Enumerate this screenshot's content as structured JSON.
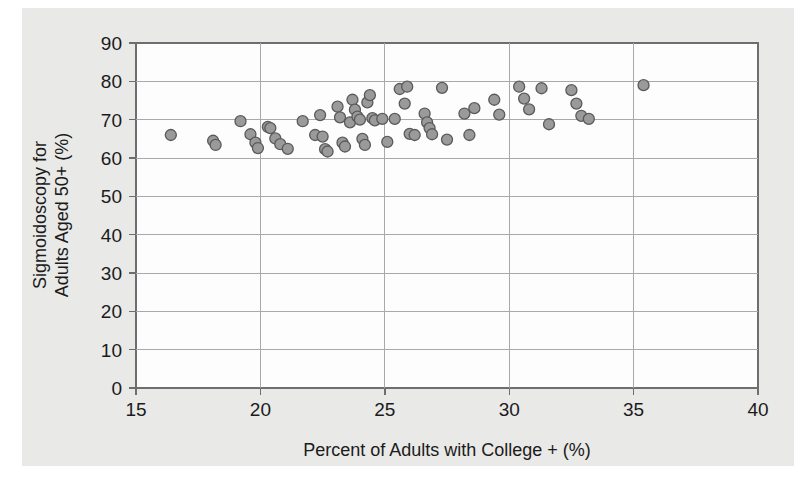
{
  "figure": {
    "background_color": "#ffffff",
    "panel_color": "#e9e9e7",
    "plot_area_color": "#fdfdfd",
    "frame_color": "#6e6e6e",
    "gridline_color": "#a9a9a9",
    "marker_fill_color": "#9a9a9a",
    "marker_stroke_color": "#5a5a5a"
  },
  "chart_data": {
    "type": "scatter",
    "title": "",
    "xlabel": "Percent of Adults with College + (%)",
    "ylabel": "Sigmoidoscopy for Adults Aged 50+ (%)",
    "ylabel_line1": "Sigmoidoscopy for",
    "ylabel_line2": "Adults Aged 50+ (%)",
    "xlim": [
      15,
      40
    ],
    "ylim": [
      0,
      90
    ],
    "xticks": [
      15,
      20,
      25,
      30,
      35,
      40
    ],
    "yticks": [
      0,
      10,
      20,
      30,
      40,
      50,
      60,
      70,
      80,
      90
    ],
    "xtick_labels": [
      "15",
      "20",
      "25",
      "30",
      "35",
      "40"
    ],
    "ytick_labels": [
      "0",
      "10",
      "20",
      "30",
      "40",
      "50",
      "60",
      "70",
      "80",
      "90"
    ],
    "grid": true,
    "grid_axes": "both",
    "legend": false,
    "legend_position": "none",
    "marker": "circle",
    "marker_size": 11,
    "n_points": 62,
    "points": [
      {
        "x": 16.4,
        "y": 66.0
      },
      {
        "x": 18.1,
        "y": 64.5
      },
      {
        "x": 18.2,
        "y": 63.4
      },
      {
        "x": 19.2,
        "y": 69.6
      },
      {
        "x": 19.6,
        "y": 66.2
      },
      {
        "x": 19.8,
        "y": 64.0
      },
      {
        "x": 19.9,
        "y": 62.6
      },
      {
        "x": 20.3,
        "y": 68.1
      },
      {
        "x": 20.4,
        "y": 67.8
      },
      {
        "x": 20.6,
        "y": 65.1
      },
      {
        "x": 20.8,
        "y": 63.6
      },
      {
        "x": 21.1,
        "y": 62.4
      },
      {
        "x": 21.7,
        "y": 69.6
      },
      {
        "x": 22.2,
        "y": 66.0
      },
      {
        "x": 22.4,
        "y": 71.2
      },
      {
        "x": 22.5,
        "y": 65.6
      },
      {
        "x": 22.6,
        "y": 62.3
      },
      {
        "x": 22.7,
        "y": 61.7
      },
      {
        "x": 23.1,
        "y": 73.4
      },
      {
        "x": 23.2,
        "y": 70.6
      },
      {
        "x": 23.3,
        "y": 64.0
      },
      {
        "x": 23.4,
        "y": 63.0
      },
      {
        "x": 23.6,
        "y": 69.3
      },
      {
        "x": 23.7,
        "y": 75.2
      },
      {
        "x": 23.8,
        "y": 72.6
      },
      {
        "x": 23.9,
        "y": 70.8
      },
      {
        "x": 24.0,
        "y": 70.0
      },
      {
        "x": 24.1,
        "y": 65.0
      },
      {
        "x": 24.2,
        "y": 63.4
      },
      {
        "x": 24.3,
        "y": 74.5
      },
      {
        "x": 24.4,
        "y": 76.4
      },
      {
        "x": 24.5,
        "y": 70.4
      },
      {
        "x": 24.6,
        "y": 69.8
      },
      {
        "x": 24.9,
        "y": 70.2
      },
      {
        "x": 25.1,
        "y": 64.2
      },
      {
        "x": 25.4,
        "y": 70.2
      },
      {
        "x": 25.6,
        "y": 78.0
      },
      {
        "x": 25.8,
        "y": 74.2
      },
      {
        "x": 25.9,
        "y": 78.6
      },
      {
        "x": 26.0,
        "y": 66.3
      },
      {
        "x": 26.2,
        "y": 66.0
      },
      {
        "x": 26.6,
        "y": 71.6
      },
      {
        "x": 26.7,
        "y": 69.3
      },
      {
        "x": 26.8,
        "y": 67.8
      },
      {
        "x": 26.9,
        "y": 66.2
      },
      {
        "x": 27.3,
        "y": 78.3
      },
      {
        "x": 27.5,
        "y": 64.8
      },
      {
        "x": 28.2,
        "y": 71.6
      },
      {
        "x": 28.4,
        "y": 66.0
      },
      {
        "x": 28.6,
        "y": 73.0
      },
      {
        "x": 29.4,
        "y": 75.2
      },
      {
        "x": 29.6,
        "y": 71.3
      },
      {
        "x": 30.4,
        "y": 78.6
      },
      {
        "x": 30.6,
        "y": 75.5
      },
      {
        "x": 30.8,
        "y": 72.7
      },
      {
        "x": 31.3,
        "y": 78.2
      },
      {
        "x": 31.6,
        "y": 68.8
      },
      {
        "x": 32.5,
        "y": 77.7
      },
      {
        "x": 32.7,
        "y": 74.2
      },
      {
        "x": 32.9,
        "y": 71.0
      },
      {
        "x": 33.2,
        "y": 70.2
      },
      {
        "x": 35.4,
        "y": 79.0
      }
    ]
  }
}
